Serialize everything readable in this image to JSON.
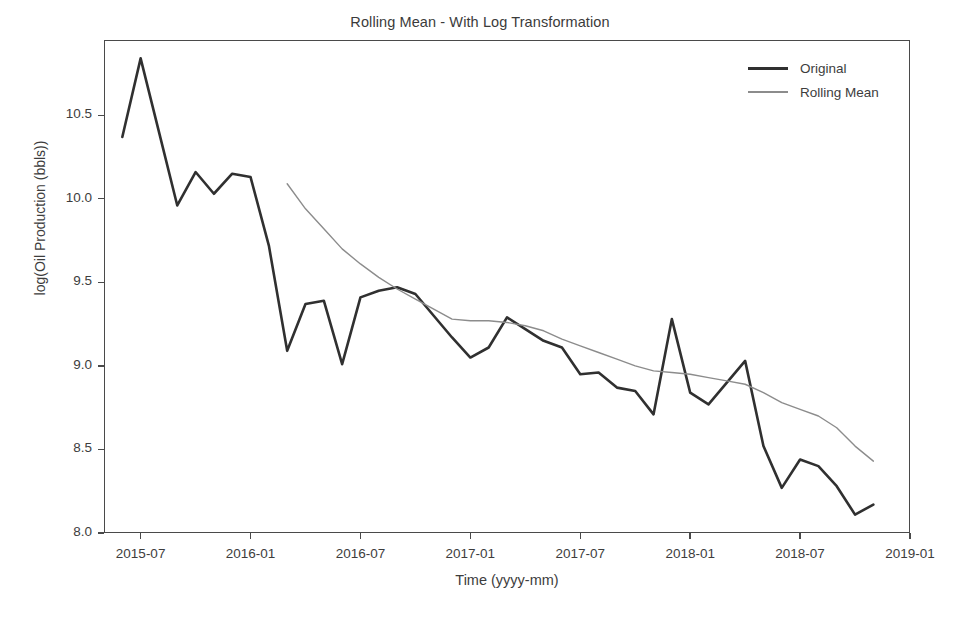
{
  "chart_data": {
    "type": "line",
    "title": "Rolling Mean - With Log Transformation",
    "xlabel": "Time (yyyy-mm)",
    "ylabel": "log(Oil Production (bbls))",
    "grid": false,
    "legend_position": "top-right",
    "ylim": [
      8.0,
      10.95
    ],
    "yticks": [
      8.0,
      8.5,
      9.0,
      9.5,
      10.0,
      10.5
    ],
    "ytick_labels": [
      "8.0",
      "8.5",
      "9.0",
      "9.5",
      "10.0",
      "10.5"
    ],
    "xlim": [
      "2015-05",
      "2019-01"
    ],
    "xticks": [
      "2015-07",
      "2016-01",
      "2016-07",
      "2017-01",
      "2017-07",
      "2018-01",
      "2018-07",
      "2019-01"
    ],
    "xtick_labels": [
      "2015-07",
      "2016-01",
      "2016-07",
      "2017-01",
      "2017-07",
      "2018-01",
      "2018-07",
      "2019-01"
    ],
    "x": [
      "2015-06",
      "2015-07",
      "2015-08",
      "2015-09",
      "2015-10",
      "2015-11",
      "2015-12",
      "2016-01",
      "2016-02",
      "2016-03",
      "2016-04",
      "2016-05",
      "2016-06",
      "2016-07",
      "2016-08",
      "2016-09",
      "2016-10",
      "2016-11",
      "2016-12",
      "2017-01",
      "2017-02",
      "2017-03",
      "2017-04",
      "2017-05",
      "2017-06",
      "2017-07",
      "2017-08",
      "2017-09",
      "2017-10",
      "2017-11",
      "2017-12",
      "2018-01",
      "2018-02",
      "2018-03",
      "2018-04",
      "2018-05",
      "2018-06",
      "2018-07",
      "2018-08",
      "2018-09",
      "2018-10",
      "2018-11"
    ],
    "series": [
      {
        "name": "Original",
        "color": "#303030",
        "linewidth": 2.6,
        "values": [
          10.37,
          10.84,
          10.4,
          9.96,
          10.16,
          10.03,
          10.15,
          10.13,
          9.72,
          9.09,
          9.37,
          9.39,
          9.01,
          9.41,
          9.45,
          9.47,
          9.43,
          9.3,
          9.17,
          9.05,
          9.11,
          9.29,
          9.22,
          9.15,
          9.11,
          8.95,
          8.96,
          8.87,
          8.85,
          8.71,
          9.28,
          8.84,
          8.77,
          8.9,
          9.03,
          8.52,
          8.27,
          8.44,
          8.4,
          8.28,
          8.11,
          8.17
        ]
      },
      {
        "name": "Rolling Mean",
        "color": "#8c8c8c",
        "linewidth": 1.4,
        "values": [
          null,
          null,
          null,
          null,
          null,
          null,
          null,
          null,
          null,
          10.09,
          9.94,
          9.82,
          9.7,
          9.61,
          9.53,
          9.46,
          9.4,
          9.34,
          9.28,
          9.27,
          9.27,
          9.26,
          9.24,
          9.21,
          9.16,
          9.12,
          9.08,
          9.04,
          9.0,
          8.97,
          8.96,
          8.95,
          8.93,
          8.91,
          8.89,
          8.84,
          8.78,
          8.74,
          8.7,
          8.63,
          8.52,
          8.43
        ]
      }
    ],
    "legend": [
      "Original",
      "Rolling Mean"
    ]
  },
  "axes": {
    "title": "Rolling Mean - With Log Transformation",
    "xlabel": "Time (yyyy-mm)",
    "ylabel": "log(Oil Production (bbls))"
  }
}
